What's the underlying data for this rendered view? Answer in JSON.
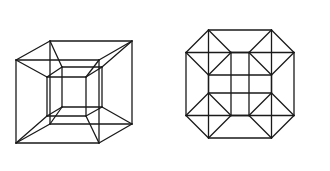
{
  "figure": {
    "background": "#ffffff",
    "stroke_color": "#1a1a1a",
    "figures": [
      {
        "name": "tesseract-cube-in-cube",
        "description": "Perspective projection of a tesseract as a cube within a cube",
        "squares": {
          "outer_front": [
            16,
            60,
            99,
            143
          ],
          "outer_back": [
            50,
            41,
            132,
            124
          ],
          "inner_front": [
            47,
            77,
            86,
            116
          ],
          "inner_back": [
            62,
            67,
            102,
            107
          ]
        },
        "connections": [
          [
            "outer_front",
            "outer_back"
          ],
          [
            "outer_front",
            "inner_front"
          ],
          [
            "outer_back",
            "inner_back"
          ],
          [
            "inner_front",
            "inner_back"
          ]
        ]
      },
      {
        "name": "tesseract-octagonal-projection",
        "description": "Orthogonal projection of a tesseract with octagonal outline",
        "center": [
          240,
          84
        ],
        "basis": [
          [
            63,
            0
          ],
          [
            22.5,
            22.5
          ],
          [
            0,
            63
          ],
          [
            -22.5,
            22.5
          ]
        ]
      }
    ]
  }
}
